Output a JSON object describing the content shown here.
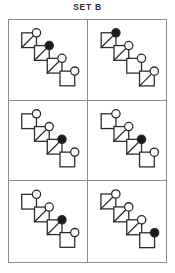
{
  "header": {
    "title": "SET B"
  },
  "colors": {
    "stroke": "#2b2b2b",
    "frame": "#8c8c8c",
    "fill_circle": "#1a1a1a",
    "open_circle": "#ffffff",
    "background": "#ffffff"
  },
  "grid": {
    "rows": 3,
    "columns": 2,
    "cell_count": 6
  },
  "figure_spec": {
    "description": "Diagonal staircase chain of four squares descending to the right; each square carries a circle at its upper-right corner; exactly one circle per figure is filled black.",
    "square_count": 4,
    "circle_count": 4,
    "diagonal_count": 3
  },
  "cells": [
    {
      "id": "cell-1",
      "name": "top-left",
      "row": 1,
      "column": 1,
      "filled_circle_index": 2,
      "diagonals": [
        1,
        2,
        3
      ]
    },
    {
      "id": "cell-2",
      "name": "top-right",
      "row": 1,
      "column": 2,
      "filled_circle_index": 1,
      "diagonals": [
        1,
        2,
        4
      ]
    },
    {
      "id": "cell-3",
      "name": "middle-left",
      "row": 2,
      "column": 1,
      "filled_circle_index": 3,
      "diagonals": [
        2,
        3
      ]
    },
    {
      "id": "cell-4",
      "name": "middle-right",
      "row": 2,
      "column": 2,
      "filled_circle_index": 3,
      "diagonals": [
        2,
        3
      ]
    },
    {
      "id": "cell-5",
      "name": "bottom-left",
      "row": 3,
      "column": 1,
      "filled_circle_index": 3,
      "diagonals": [
        2,
        3
      ]
    },
    {
      "id": "cell-6",
      "name": "bottom-right",
      "row": 3,
      "column": 2,
      "filled_circle_index": 4,
      "diagonals": [
        1,
        2,
        3
      ]
    }
  ]
}
